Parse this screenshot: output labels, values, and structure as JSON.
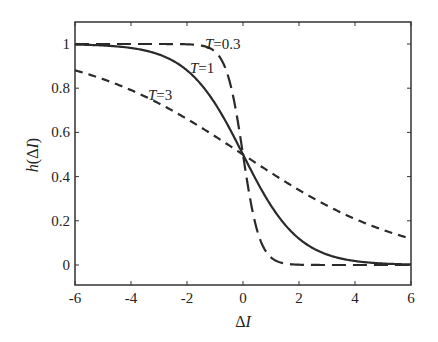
{
  "chart_data": {
    "type": "line",
    "title": "",
    "xlabel": "ΔI",
    "ylabel": "h(ΔI)",
    "xlim": [
      -6,
      6
    ],
    "ylim": [
      -0.1,
      1.1
    ],
    "xticks": [
      -6,
      -4,
      -2,
      0,
      2,
      4,
      6
    ],
    "xtick_labels": [
      "-6",
      "-4",
      "-2",
      "0",
      "2",
      "4",
      "6"
    ],
    "yticks": [
      0,
      0.2,
      0.4,
      0.6,
      0.8,
      1
    ],
    "ytick_labels": [
      "0",
      "0.2",
      "0.4",
      "0.6",
      "0.8",
      "1"
    ],
    "grid": false,
    "legend": "inline annotations",
    "function": "h(ΔI) = 1 / (1 + exp(ΔI / T))",
    "x": [
      -6,
      -5,
      -4,
      -3,
      -2,
      -1,
      0,
      1,
      2,
      3,
      4,
      5,
      6
    ],
    "series": [
      {
        "name": "T=0.3",
        "T": 0.3,
        "style": "long-dash",
        "values": [
          1.0,
          1.0,
          1.0,
          1.0,
          0.999,
          0.966,
          0.5,
          0.034,
          0.001,
          0.0,
          0.0,
          0.0,
          0.0
        ]
      },
      {
        "name": "T=1",
        "T": 1,
        "style": "solid",
        "values": [
          0.998,
          0.993,
          0.982,
          0.953,
          0.881,
          0.731,
          0.5,
          0.269,
          0.119,
          0.047,
          0.018,
          0.007,
          0.002
        ]
      },
      {
        "name": "T=3",
        "T": 3,
        "style": "short-dash",
        "values": [
          0.881,
          0.841,
          0.791,
          0.731,
          0.661,
          0.583,
          0.5,
          0.417,
          0.339,
          0.269,
          0.209,
          0.159,
          0.119
        ]
      }
    ],
    "annotations": [
      {
        "text": "T=0.3",
        "x": -0.2,
        "y": 1.0
      },
      {
        "text": "T=1",
        "x": -1.2,
        "y": 0.92
      },
      {
        "text": "T=3",
        "x": -3.7,
        "y": 0.78
      }
    ]
  }
}
